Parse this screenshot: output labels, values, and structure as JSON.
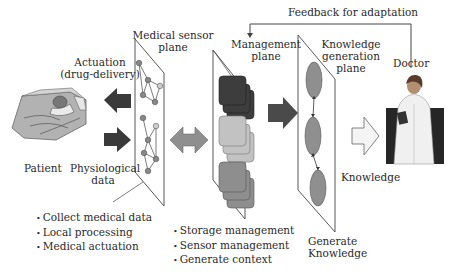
{
  "title": "",
  "labels": {
    "feedback": "Feedback for adaptation",
    "sensor_plane": [
      "Medical sensor",
      "plane"
    ],
    "management_plane": [
      "Management",
      "plane"
    ],
    "knowledge_plane": [
      "Knowledge",
      "generation",
      "plane"
    ],
    "doctor": "Doctor",
    "actuation": [
      "Actuation",
      "(drug-delivery)"
    ],
    "patient": "Patient",
    "physiological": [
      "Physiological",
      "data"
    ],
    "knowledge": "Knowledge",
    "generate_knowledge": [
      "Generate",
      "Knowledge"
    ]
  },
  "bullets": {
    "sensor": [
      "Collect medical data",
      "Local processing",
      "Medical actuation"
    ],
    "management": [
      "Storage management",
      "Sensor management",
      "Generate context"
    ]
  },
  "colors": {
    "dark": "#3d3d3d",
    "mid": "#8a8a8a",
    "light": "#b9b9b9",
    "node": "#8c8c8c",
    "arrow_dark": "#3a3a3a",
    "arrow_light": "#f2f2f2"
  }
}
